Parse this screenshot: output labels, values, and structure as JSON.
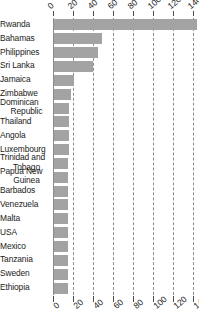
{
  "chart_data": {
    "type": "bar",
    "orientation": "horizontal",
    "title": "",
    "xlabel": "",
    "ylabel": "",
    "xlim": [
      0,
      146
    ],
    "grid": true,
    "grid_axis": "x",
    "legend": false,
    "bar_color": "#a3a3a3",
    "axis_color": "#4d4d4d",
    "gridline_color": "#8c8c8c",
    "tick_values": [
      0,
      20,
      40,
      60,
      80,
      100,
      120,
      140
    ],
    "tick_labels": [
      "0",
      "20",
      "40",
      "60",
      "80",
      "100",
      "140"
    ],
    "top_axis_labels": [
      "0",
      "20",
      "40",
      "60",
      "80",
      "100",
      "120",
      "140"
    ],
    "bottom_axis_labels": [
      "0",
      "20",
      "40",
      "60",
      "80",
      "100",
      "120",
      "140"
    ],
    "categories": [
      "Rwanda",
      "Bahamas",
      "Philippines",
      "Sri Lanka",
      "Jamaica",
      "Zimbabwe",
      "Dominican Republic",
      "Thailand",
      "Angola",
      "Luxembourg",
      "Trinidad and Tobago",
      "Papua New Guinea",
      "Barbados",
      "Venezuela",
      "Malta",
      "USA",
      "Mexico",
      "Tanzania",
      "Sweden",
      "Ethiopia"
    ],
    "category_lines": [
      [
        "Rwanda"
      ],
      [
        "Bahamas"
      ],
      [
        "Philippines"
      ],
      [
        "Sri Lanka"
      ],
      [
        "Jamaica"
      ],
      [
        "Zimbabwe"
      ],
      [
        "Dominican",
        "Republic"
      ],
      [
        "Thailand"
      ],
      [
        "Angola"
      ],
      [
        "Luxembourg"
      ],
      [
        "Trinidad and",
        "Tobago"
      ],
      [
        "Papua New",
        "Guinea"
      ],
      [
        "Barbados"
      ],
      [
        "Venezuela"
      ],
      [
        "Malta"
      ],
      [
        "USA"
      ],
      [
        "Mexico"
      ],
      [
        "Tanzania"
      ],
      [
        "Sweden"
      ],
      [
        "Ethiopia"
      ]
    ],
    "values": [
      143,
      48,
      44,
      39,
      20,
      17,
      15,
      15,
      15,
      15,
      14,
      14,
      14,
      14,
      14,
      14,
      14,
      14,
      14,
      14
    ]
  }
}
